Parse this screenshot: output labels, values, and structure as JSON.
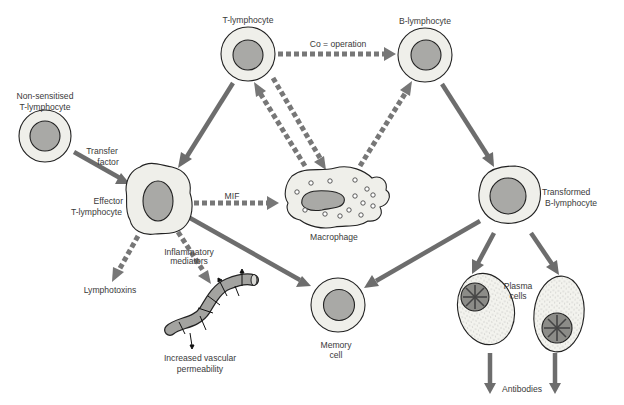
{
  "diagram": {
    "type": "immune-response-flow",
    "cells": {
      "t_lymphocyte": "T-lymphocyte",
      "b_lymphocyte": "B-lymphocyte",
      "non_sensitised_line1": "Non-sensitised",
      "non_sensitised_line2": "T-lymphocyte",
      "effector_line1": "Effector",
      "effector_line2": "T-lymphocyte",
      "macrophage": "Macrophage",
      "transformed_line1": "Transformed",
      "transformed_line2": "B-lymphocyte",
      "memory_line1": "Memory",
      "memory_line2": "cell",
      "plasma_line1": "Plasma",
      "plasma_line2": "cells"
    },
    "edge_labels": {
      "cooperation": "Co = operation",
      "transfer_line1": "Transfer",
      "transfer_line2": "factor",
      "mif": "MIF",
      "inflammatory_line1": "Inflammatory",
      "inflammatory_line2": "mediators"
    },
    "outputs": {
      "lymphotoxins": "Lymphotoxins",
      "vascular_line1": "Increased vascular",
      "vascular_line2": "permeability",
      "antibodies": "Antibodies"
    },
    "colors": {
      "arrow": "#6d6d6d",
      "cytoplasm": "#efefea",
      "nucleus": "#a9a9a6",
      "outline": "#222222"
    }
  }
}
